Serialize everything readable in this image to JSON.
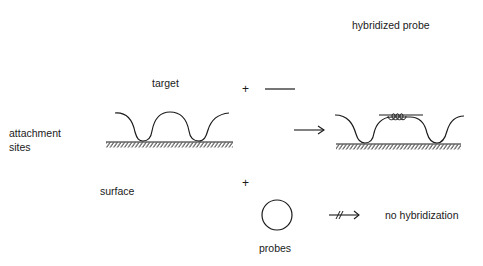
{
  "labels": {
    "hybridized_probe": "hybridized probe",
    "target": "target",
    "attachment_sites_line1": "attachment",
    "attachment_sites_line2": "sites",
    "surface": "surface",
    "probes": "probes",
    "no_hybridization": "no hybridization",
    "plus_top": "+",
    "plus_bottom": "+"
  },
  "elements": {
    "linear_probe": "straight-line probe",
    "circular_probe": "circle probe",
    "reaction_arrow": "arrow (hybridization occurs)",
    "blocked_arrow": "arrow crossed out (no reaction)",
    "left_surface": "surface with target strand attached at sites",
    "right_surface": "surface with target strand and hybridized probe"
  },
  "colors": {
    "ink": "#1a1a1a",
    "background": "#ffffff"
  }
}
